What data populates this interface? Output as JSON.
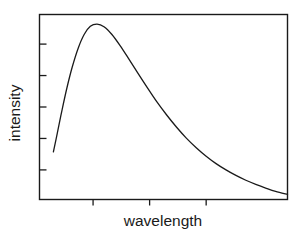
{
  "chart_data": {
    "type": "line",
    "title": "",
    "xlabel": "wavelength",
    "ylabel": "intensity",
    "grid": false,
    "legend": null,
    "xlim": [
      0,
      1
    ],
    "ylim": [
      0,
      1
    ],
    "axis_ticks": {
      "x_tick_fractions": [
        0.216,
        0.444,
        0.672
      ],
      "x_tick_labels": [
        "",
        "",
        ""
      ],
      "y_tick_fractions": [
        0.16,
        0.33,
        0.5,
        0.67,
        0.84
      ],
      "y_tick_labels": [
        "",
        "",
        "",
        "",
        ""
      ],
      "x_tick_direction": "out",
      "y_tick_direction": "in"
    },
    "series": [
      {
        "name": "spectral intensity",
        "x": [
          0.056,
          0.072,
          0.09,
          0.11,
          0.132,
          0.156,
          0.18,
          0.205,
          0.232,
          0.26,
          0.292,
          0.325,
          0.36,
          0.396,
          0.434,
          0.472,
          0.512,
          0.552,
          0.592,
          0.632,
          0.672,
          0.712,
          0.752,
          0.792,
          0.832,
          0.872,
          0.912,
          0.952,
          1.0
        ],
        "y": [
          0.258,
          0.36,
          0.478,
          0.6,
          0.716,
          0.818,
          0.892,
          0.936,
          0.948,
          0.934,
          0.892,
          0.832,
          0.76,
          0.684,
          0.606,
          0.53,
          0.458,
          0.392,
          0.332,
          0.28,
          0.234,
          0.194,
          0.16,
          0.13,
          0.104,
          0.082,
          0.062,
          0.044,
          0.028
        ],
        "peak_x": 0.232,
        "peak_y": 0.948,
        "color": "#1a1a1a",
        "linewidth": 1.3
      }
    ],
    "frame": {
      "color": "#1a1a1a",
      "linewidth": 1.4,
      "sides": [
        "top",
        "right",
        "bottom",
        "left"
      ]
    }
  }
}
